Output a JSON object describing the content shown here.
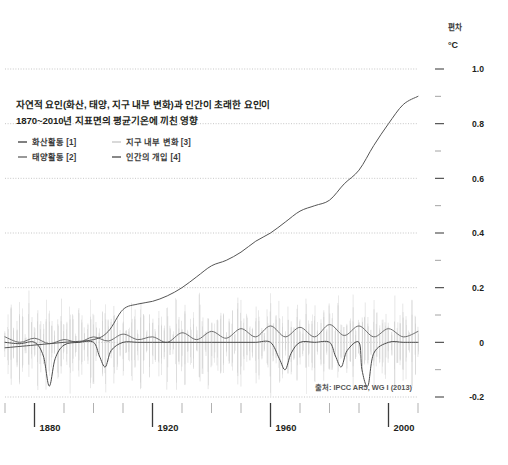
{
  "chart_data": {
    "type": "line",
    "title_line1": "자연적 요인(화산, 태양, 지구 내부 변화)과 인간이 초래한 요인이",
    "title_line2": "1870~2010년 지표면의 평균기온에 끼친 영향",
    "axis_label": "편차",
    "axis_unit": "°C",
    "source": "출처: IPCC AR5, WG I (2013)",
    "xlabel": "",
    "ylabel": "편차 °C",
    "xlim": [
      1870,
      2010
    ],
    "ylim": [
      -0.2,
      1.0
    ],
    "grid": true,
    "legend_position": "top-left",
    "xticks": [
      "1880",
      "1920",
      "1960",
      "2000"
    ],
    "xtick_values": [
      1880,
      1920,
      1960,
      2000
    ],
    "xminor_step": 10,
    "yticks": [
      "1.0",
      "0.8",
      "0.6",
      "0.4",
      "0.2",
      "0",
      "-0.2"
    ],
    "ytick_values": [
      1.0,
      0.8,
      0.6,
      0.4,
      0.2,
      0,
      -0.2
    ],
    "yminor_step": 0.1,
    "legend": [
      {
        "label": "화산활동 [1]",
        "color": "#4a4a4a"
      },
      {
        "label": "태양활동 [2]",
        "color": "#6e6e6e"
      },
      {
        "label": "지구 내부 변화 [3]",
        "color": "#c9c9c9"
      },
      {
        "label": "인간의 개입 [4]",
        "color": "#555555"
      }
    ],
    "series": [
      {
        "name": "지구 내부 변화 [3]",
        "color": "#c9c9c9",
        "type": "noise",
        "x": [
          1870,
          1871,
          1872,
          1873,
          1874,
          1875,
          1876,
          1877,
          1878,
          1879,
          1880,
          1881,
          1882,
          1883,
          1884,
          1885,
          1886,
          1887,
          1888,
          1889,
          1890,
          1891,
          1892,
          1893,
          1894,
          1895,
          1896,
          1897,
          1898,
          1899,
          1900,
          1901,
          1902,
          1903,
          1904,
          1905,
          1906,
          1907,
          1908,
          1909,
          1910,
          1911,
          1912,
          1913,
          1914,
          1915,
          1916,
          1917,
          1918,
          1919,
          1920,
          1921,
          1922,
          1923,
          1924,
          1925,
          1926,
          1927,
          1928,
          1929,
          1930,
          1931,
          1932,
          1933,
          1934,
          1935,
          1936,
          1937,
          1938,
          1939,
          1940,
          1941,
          1942,
          1943,
          1944,
          1945,
          1946,
          1947,
          1948,
          1949,
          1950,
          1951,
          1952,
          1953,
          1954,
          1955,
          1956,
          1957,
          1958,
          1959,
          1960,
          1961,
          1962,
          1963,
          1964,
          1965,
          1966,
          1967,
          1968,
          1969,
          1970,
          1971,
          1972,
          1973,
          1974,
          1975,
          1976,
          1977,
          1978,
          1979,
          1980,
          1981,
          1982,
          1983,
          1984,
          1985,
          1986,
          1987,
          1988,
          1989,
          1990,
          1991,
          1992,
          1993,
          1994,
          1995,
          1996,
          1997,
          1998,
          1999,
          2000,
          2001,
          2002,
          2003,
          2004,
          2005,
          2006,
          2007,
          2008,
          2009,
          2010
        ],
        "values": [
          0.04,
          -0.09,
          0.12,
          -0.05,
          0.08,
          -0.12,
          0.1,
          -0.03,
          0.16,
          -0.08,
          0.05,
          -0.14,
          0.09,
          -0.06,
          0.13,
          -0.1,
          0.07,
          -0.04,
          0.11,
          -0.13,
          0.06,
          -0.07,
          0.15,
          -0.09,
          0.04,
          -0.11,
          0.1,
          -0.05,
          0.08,
          -0.14,
          0.12,
          -0.06,
          0.05,
          -0.1,
          0.14,
          -0.08,
          0.07,
          -0.12,
          0.09,
          -0.04,
          0.11,
          -0.07,
          0.06,
          -0.13,
          0.1,
          -0.05,
          0.15,
          -0.09,
          0.04,
          -0.11,
          0.08,
          -0.06,
          0.12,
          -0.1,
          0.07,
          -0.14,
          0.05,
          -0.04,
          0.13,
          -0.08,
          0.09,
          -0.12,
          0.06,
          -0.07,
          0.11,
          -0.05,
          0.15,
          -0.1,
          0.04,
          -0.13,
          0.08,
          -0.06,
          0.1,
          -0.09,
          0.12,
          -0.04,
          0.07,
          -0.11,
          0.05,
          -0.14,
          0.13,
          -0.08,
          0.09,
          -0.05,
          0.06,
          -0.12,
          0.11,
          -0.07,
          0.04,
          -0.1,
          0.15,
          -0.06,
          0.08,
          -0.13,
          0.1,
          -0.04,
          0.12,
          -0.09,
          0.05,
          -0.11,
          0.07,
          -0.05,
          0.14,
          -0.08,
          0.09,
          -0.12,
          0.06,
          -0.07,
          0.11,
          -0.04,
          0.13,
          -0.1,
          0.05,
          -0.14,
          0.08,
          -0.06,
          0.1,
          -0.09,
          0.15,
          -0.05,
          0.07,
          -0.11,
          0.12,
          -0.08,
          0.04,
          -0.13,
          0.09,
          -0.06,
          0.11,
          -0.1,
          0.06,
          -0.04,
          0.14,
          -0.07,
          0.08,
          -0.12,
          0.1,
          -0.05,
          0.13,
          -0.09,
          0.05
        ]
      },
      {
        "name": "태양활동 [2]",
        "color": "#6e6e6e",
        "type": "line",
        "x": [
          1870,
          1875,
          1880,
          1885,
          1890,
          1895,
          1900,
          1905,
          1910,
          1915,
          1920,
          1925,
          1930,
          1935,
          1940,
          1945,
          1950,
          1955,
          1960,
          1965,
          1970,
          1975,
          1980,
          1985,
          1990,
          1995,
          2000,
          2005,
          2010
        ],
        "values": [
          0.02,
          0.0,
          0.015,
          -0.005,
          0.01,
          0.0,
          0.02,
          0.005,
          0.03,
          0.01,
          0.02,
          0.0,
          0.035,
          0.01,
          0.04,
          0.015,
          0.05,
          0.02,
          0.06,
          0.02,
          0.055,
          0.02,
          0.065,
          0.025,
          0.06,
          0.02,
          0.05,
          0.02,
          0.04
        ]
      },
      {
        "name": "화산활동 [1]",
        "color": "#4a4a4a",
        "type": "line",
        "x": [
          1870,
          1875,
          1880,
          1883,
          1885,
          1887,
          1890,
          1895,
          1900,
          1902,
          1904,
          1906,
          1910,
          1915,
          1920,
          1925,
          1930,
          1935,
          1940,
          1945,
          1950,
          1955,
          1960,
          1963,
          1965,
          1967,
          1970,
          1975,
          1980,
          1982,
          1984,
          1986,
          1990,
          1991,
          1993,
          1995,
          2000,
          2005,
          2010
        ],
        "values": [
          0.0,
          -0.005,
          0.0,
          -0.05,
          -0.16,
          -0.06,
          -0.01,
          0.0,
          0.0,
          -0.05,
          -0.09,
          -0.03,
          0.0,
          0.0,
          0.0,
          0.0,
          0.0,
          0.0,
          0.0,
          0.0,
          0.0,
          0.0,
          0.0,
          -0.06,
          -0.1,
          -0.04,
          0.0,
          0.0,
          0.0,
          -0.05,
          -0.09,
          -0.03,
          0.0,
          -0.1,
          -0.16,
          -0.04,
          0.0,
          0.0,
          0.0
        ]
      },
      {
        "name": "인간의 개입 [4]",
        "color": "#555555",
        "type": "line",
        "x": [
          1870,
          1880,
          1890,
          1900,
          1905,
          1910,
          1915,
          1920,
          1925,
          1930,
          1935,
          1940,
          1945,
          1950,
          1955,
          1960,
          1965,
          1970,
          1975,
          1980,
          1985,
          1990,
          1995,
          2000,
          2005,
          2010
        ],
        "values": [
          -0.02,
          -0.01,
          0.0,
          0.01,
          0.04,
          0.12,
          0.14,
          0.15,
          0.17,
          0.2,
          0.24,
          0.28,
          0.3,
          0.33,
          0.37,
          0.4,
          0.44,
          0.48,
          0.5,
          0.52,
          0.58,
          0.63,
          0.72,
          0.8,
          0.87,
          0.9
        ]
      }
    ]
  }
}
